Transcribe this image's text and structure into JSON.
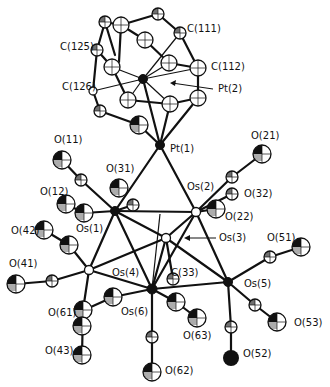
{
  "figure": {
    "type": "ORTEP molecular structure",
    "labels": [
      {
        "id": "C111",
        "text": "C(111)",
        "x": 187,
        "y": 32
      },
      {
        "id": "C112",
        "text": "C(112)",
        "x": 211,
        "y": 70
      },
      {
        "id": "C125",
        "text": "C(125)",
        "x": 60,
        "y": 50
      },
      {
        "id": "C126",
        "text": "C(126)",
        "x": 62,
        "y": 90
      },
      {
        "id": "Pt2",
        "text": "Pt(2)",
        "x": 218,
        "y": 92
      },
      {
        "id": "Pt1",
        "text": "Pt(1)",
        "x": 170,
        "y": 152
      },
      {
        "id": "O11",
        "text": "O(11)",
        "x": 54,
        "y": 143
      },
      {
        "id": "O21",
        "text": "O(21)",
        "x": 251,
        "y": 139
      },
      {
        "id": "O31",
        "text": "O(31)",
        "x": 106,
        "y": 172
      },
      {
        "id": "Os2",
        "text": "Os(2)",
        "x": 187,
        "y": 190
      },
      {
        "id": "O32",
        "text": "O(32)",
        "x": 244,
        "y": 197
      },
      {
        "id": "O12",
        "text": "O(12)",
        "x": 40,
        "y": 195
      },
      {
        "id": "O22",
        "text": "O(22)",
        "x": 225,
        "y": 220
      },
      {
        "id": "O42",
        "text": "O(42)",
        "x": 11,
        "y": 234
      },
      {
        "id": "Os1",
        "text": "Os(1)",
        "x": 76,
        "y": 232
      },
      {
        "id": "Os3",
        "text": "Os(3)",
        "x": 219,
        "y": 241
      },
      {
        "id": "O51",
        "text": "O(51)",
        "x": 267,
        "y": 241
      },
      {
        "id": "O41",
        "text": "O(41)",
        "x": 9,
        "y": 267
      },
      {
        "id": "Os4",
        "text": "Os(4)",
        "x": 112,
        "y": 276
      },
      {
        "id": "C33",
        "text": "C(33)",
        "x": 171,
        "y": 276
      },
      {
        "id": "Os5",
        "text": "Os(5)",
        "x": 244,
        "y": 287
      },
      {
        "id": "O61",
        "text": "O(61)",
        "x": 48,
        "y": 316
      },
      {
        "id": "Os6",
        "text": "Os(6)",
        "x": 121,
        "y": 315
      },
      {
        "id": "O63",
        "text": "O(63)",
        "x": 183,
        "y": 339
      },
      {
        "id": "O53",
        "text": "O(53)",
        "x": 294,
        "y": 326
      },
      {
        "id": "O43",
        "text": "O(43)",
        "x": 45,
        "y": 354
      },
      {
        "id": "O52",
        "text": "O(52)",
        "x": 243,
        "y": 357
      },
      {
        "id": "O62",
        "text": "O(62)",
        "x": 165,
        "y": 374
      }
    ],
    "arrows": [
      {
        "id": "Pt2-arrow",
        "from": [
          213,
          89
        ],
        "to": [
          170,
          84
        ]
      },
      {
        "id": "Os3-arrow",
        "from": [
          217,
          238
        ],
        "to": [
          186,
          238
        ]
      }
    ]
  }
}
